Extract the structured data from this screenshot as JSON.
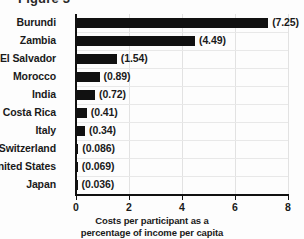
{
  "title_fragment": "Figure 3",
  "chart_data": {
    "type": "bar",
    "orientation": "horizontal",
    "title": "",
    "categories": [
      "Burundi",
      "Zambia",
      "El Salvador",
      "Morocco",
      "India",
      "Costa Rica",
      "Italy",
      "Switzerland",
      "United States",
      "Japan"
    ],
    "values": [
      7.25,
      4.49,
      1.54,
      0.89,
      0.72,
      0.41,
      0.34,
      0.086,
      0.069,
      0.036
    ],
    "value_labels": [
      "(7.25)",
      "(4.49)",
      "(1.54)",
      "(0.89)",
      "(0.72)",
      "(0.41)",
      "(0.34)",
      "(0.086)",
      "(0.069)",
      "(0.036)"
    ],
    "xlabel_lines": [
      "Costs per participant as a",
      "percentage of income per capita"
    ],
    "ylabel": "",
    "xlim": [
      0,
      8
    ],
    "xticks": [
      0,
      2,
      4,
      6,
      8
    ],
    "xtick_labels": [
      "0",
      "2",
      "4",
      "6",
      "8"
    ],
    "grid": true,
    "legend": false,
    "bar_color": "#111111",
    "grid_color": "#e2e2e2",
    "background_color": "#fdfdfd"
  }
}
